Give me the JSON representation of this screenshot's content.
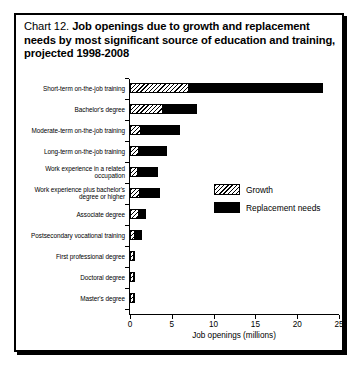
{
  "chart_card": {
    "title_lead": "Chart 12. ",
    "title_strong": "Job openings due to growth and replacement needs by most significant source of education and training, projected 1998-2008"
  },
  "legend": {
    "position": "inside-right",
    "items": [
      {
        "key": "growth",
        "label": "Growth",
        "swatch": "hatched-diagonal"
      },
      {
        "key": "replacement",
        "label": "Replacement needs",
        "swatch": "solid-black"
      }
    ]
  },
  "chart_data": {
    "type": "bar",
    "orientation": "horizontal",
    "stacked": true,
    "title": "Chart 12. Job openings due to growth and replacement needs by most significant source of education and training, projected 1998-2008",
    "xlabel": "Job openings (millions)",
    "ylabel": "",
    "xlim": [
      0,
      25
    ],
    "xticks": [
      0,
      5,
      10,
      15,
      20,
      25
    ],
    "xtick_labels": [
      "0",
      "5",
      "10",
      "15",
      "20",
      "25"
    ],
    "grid": false,
    "categories": [
      "Short-term on-the-job training",
      "Bachelor's degree",
      "Moderate-term on-the-job training",
      "Long-term on-the-job training",
      "Work experience in a related occupation",
      "Work experience plus bachelor's degree or higher",
      "Associate degree",
      "Postsecondary vocational training",
      "First professional degree",
      "Doctoral degree",
      "Master's degree"
    ],
    "series": [
      {
        "name": "Growth",
        "color": "#ffffff",
        "pattern": "hatched-diagonal",
        "values": [
          7.1,
          3.9,
          1.3,
          1.1,
          0.9,
          1.2,
          1.1,
          0.6,
          0.2,
          0.15,
          0.1
        ]
      },
      {
        "name": "Replacement needs",
        "color": "#000000",
        "pattern": "solid",
        "values": [
          16.1,
          4.2,
          4.8,
          3.4,
          2.6,
          2.5,
          0.9,
          0.9,
          0.3,
          0.25,
          0.25
        ]
      }
    ],
    "totals": [
      23.2,
      8.1,
      6.1,
      4.5,
      3.5,
      3.7,
      2.0,
      1.5,
      0.5,
      0.4,
      0.35
    ]
  }
}
